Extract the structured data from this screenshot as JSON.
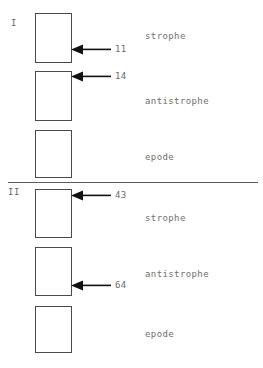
{
  "figure": {
    "top_clipped_text": "",
    "divider": {
      "top": 182
    },
    "sections": [
      {
        "numeral": "I",
        "numeral_pos": {
          "left": 11,
          "top": 19
        },
        "boxes": [
          {
            "label": "strophe",
            "top": 13,
            "height": 50,
            "label_top": 31
          },
          {
            "label": "antistrophe",
            "top": 71,
            "height": 50,
            "label_top": 96
          },
          {
            "label": "epode",
            "top": 130,
            "height": 48,
            "label_top": 152
          }
        ],
        "annotations": [
          {
            "value": "11",
            "top": 44
          },
          {
            "value": "14",
            "top": 71
          }
        ]
      },
      {
        "numeral": "II",
        "numeral_pos": {
          "left": 8,
          "top": 188
        },
        "boxes": [
          {
            "label": "strophe",
            "top": 189,
            "height": 49,
            "label_top": 213
          },
          {
            "label": "antistrophe",
            "top": 247,
            "height": 49,
            "label_top": 269
          },
          {
            "label": "epode",
            "top": 306,
            "height": 47,
            "label_top": 329
          }
        ],
        "annotations": [
          {
            "value": "43",
            "top": 190
          },
          {
            "value": "64",
            "top": 280
          }
        ]
      }
    ]
  }
}
